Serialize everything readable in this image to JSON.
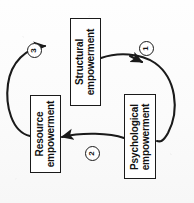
{
  "figure": {
    "orientation": "rotated-90-ccw",
    "background_color": "#fdfdfd",
    "stroke_color": "#1a1a1a",
    "text_color": "#111111"
  },
  "nodes": [
    {
      "id": "structural",
      "label_line1": "Structural",
      "label_line2": "empowerment",
      "x": 70,
      "y": 18,
      "w": 31,
      "h": 88
    },
    {
      "id": "resource",
      "label_line1": "Resource",
      "label_line2": "empowerment",
      "x": 30,
      "y": 95,
      "w": 31,
      "h": 78
    },
    {
      "id": "psychological",
      "label_line1": "Psychological",
      "label_line2": "empowerment",
      "x": 124,
      "y": 94,
      "w": 32,
      "h": 85
    }
  ],
  "edges": [
    {
      "id": "edge-1",
      "marker": "①",
      "marker_plain": "1",
      "from": "structural",
      "to": "psychological",
      "shape": "curved-arc-right"
    },
    {
      "id": "edge-2",
      "marker": "②",
      "marker_plain": "2",
      "from": "psychological",
      "to": "resource",
      "shape": "straight-horizontal"
    },
    {
      "id": "edge-3",
      "marker": "③",
      "marker_plain": "3",
      "from": "resource",
      "to": "structural",
      "shape": "curved-arc-left"
    }
  ]
}
